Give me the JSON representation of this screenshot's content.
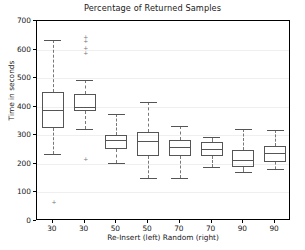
{
  "chart_data": {
    "type": "box",
    "title": "Percentage of Returned Samples",
    "xlabel": "Re-Insert (left)    Random (right)",
    "ylabel": "Time in seconds",
    "ylim": [
      0,
      700
    ],
    "yticks": [
      0,
      100,
      200,
      300,
      400,
      500,
      600,
      700
    ],
    "ytick_labels": [
      "0",
      "100",
      "200",
      "300",
      "400",
      "500",
      "600",
      "700"
    ],
    "categories": [
      "30",
      "30",
      "50",
      "50",
      "70",
      "70",
      "90",
      "90"
    ],
    "grid": true,
    "legend": "none",
    "boxes": [
      {
        "label": "30",
        "group": "Re-Insert",
        "whisker_low": 235,
        "q1": 327,
        "median": 390,
        "q3": 450,
        "whisker_high": 632,
        "fliers": [
          70
        ]
      },
      {
        "label": "30",
        "group": "Random",
        "whisker_low": 322,
        "q1": 385,
        "median": 399,
        "q3": 445,
        "whisker_high": 492,
        "fliers": [
          220,
          590,
          610,
          632,
          648
        ]
      },
      {
        "label": "50",
        "group": "Re-Insert",
        "whisker_low": 203,
        "q1": 252,
        "median": 283,
        "q3": 302,
        "whisker_high": 375,
        "fliers": []
      },
      {
        "label": "50",
        "group": "Random",
        "whisker_low": 152,
        "q1": 228,
        "median": 280,
        "q3": 312,
        "whisker_high": 418,
        "fliers": []
      },
      {
        "label": "70",
        "group": "Re-Insert",
        "whisker_low": 152,
        "q1": 227,
        "median": 258,
        "q3": 282,
        "whisker_high": 333,
        "fliers": []
      },
      {
        "label": "70",
        "group": "Random",
        "whisker_low": 190,
        "q1": 228,
        "median": 252,
        "q3": 278,
        "whisker_high": 295,
        "fliers": []
      },
      {
        "label": "90",
        "group": "Re-Insert",
        "whisker_low": 170,
        "q1": 190,
        "median": 215,
        "q3": 250,
        "whisker_high": 322,
        "fliers": []
      },
      {
        "label": "90",
        "group": "Random",
        "whisker_low": 183,
        "q1": 207,
        "median": 237,
        "q3": 262,
        "whisker_high": 318,
        "fliers": []
      }
    ],
    "colors": {
      "box_edge": "#555555",
      "median": "#555555",
      "whisker": "#777777",
      "flier": "#777777",
      "grid": "#efefef",
      "axis": "#000000",
      "text": "#1a1a1a",
      "background": "#ffffff"
    }
  }
}
